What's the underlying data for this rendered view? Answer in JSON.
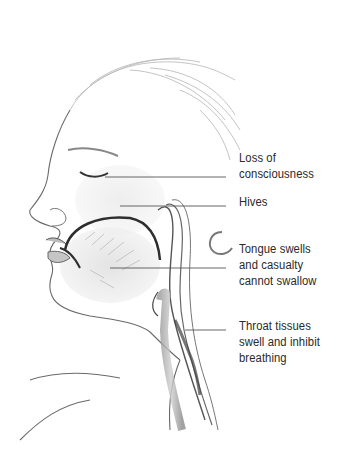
{
  "figure": {
    "line_color": "#555555",
    "text_color": "#2a2a2a"
  },
  "labels": [
    {
      "id": "loss-of-consciousness",
      "lines": [
        "Loss of",
        "consciousness"
      ]
    },
    {
      "id": "hives",
      "lines": [
        "Hives"
      ]
    },
    {
      "id": "tongue",
      "lines": [
        "Tongue swells",
        "and casualty",
        "cannot swallow"
      ]
    },
    {
      "id": "throat",
      "lines": [
        "Throat tissues",
        "swell and inhibit",
        "breathing"
      ]
    }
  ]
}
